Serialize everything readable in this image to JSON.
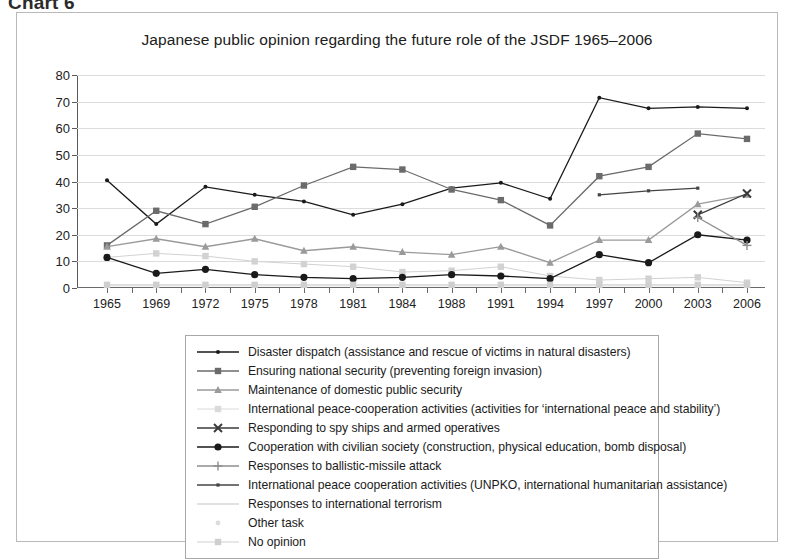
{
  "heading": "Chart 6",
  "figure": {
    "title": "Japanese public opinion regarding the future role of the JSDF 1965–2006"
  },
  "chart_data": {
    "type": "line",
    "title": "Japanese public opinion regarding the future role of the JSDF 1965–2006",
    "xlabel": "",
    "ylabel": "",
    "ylim": [
      0,
      80
    ],
    "ytick_step": 10,
    "yticks": [
      0,
      10,
      20,
      30,
      40,
      50,
      60,
      70,
      80
    ],
    "grid": true,
    "legend_position": "below-plot",
    "categories": [
      "1965",
      "1969",
      "1972",
      "1975",
      "1978",
      "1981",
      "1984",
      "1988",
      "1991",
      "1994",
      "1997",
      "2000",
      "2003",
      "2006"
    ],
    "series": [
      {
        "name": "Disaster dispatch (assistance and rescue of victims in natural disasters)",
        "marker": "diamond",
        "color": "#1a1a1a",
        "values": [
          40.5,
          24.0,
          38.0,
          35.0,
          32.5,
          27.5,
          31.5,
          37.5,
          39.5,
          33.5,
          71.5,
          67.5,
          68.0,
          67.5
        ]
      },
      {
        "name": "Ensuring national security (preventing foreign invasion)",
        "marker": "square",
        "color": "#6b6b6b",
        "values": [
          16.0,
          29.0,
          24.0,
          30.5,
          38.5,
          45.5,
          44.5,
          37.0,
          33.0,
          23.5,
          42.0,
          45.5,
          58.0,
          56.0
        ]
      },
      {
        "name": "Maintenance of domestic public security",
        "marker": "triangle",
        "color": "#9a9a9a",
        "values": [
          15.5,
          18.5,
          15.5,
          18.5,
          14.0,
          15.5,
          13.5,
          12.5,
          15.5,
          9.5,
          18.0,
          18.0,
          31.5,
          35.0
        ]
      },
      {
        "name": "International peace-cooperation activities (activities for ‘international peace and stability’)",
        "marker": "square-light",
        "color": "#d2d2d2",
        "values": [
          11.5,
          13.0,
          12.0,
          10.0,
          9.0,
          8.0,
          6.0,
          6.5,
          8.0,
          4.5,
          3.0,
          3.5,
          4.0,
          2.0
        ]
      },
      {
        "name": "Responding to spy ships and armed operatives",
        "marker": "x-mark",
        "color": "#3a3a3a",
        "values": [
          null,
          null,
          null,
          null,
          null,
          null,
          null,
          null,
          null,
          null,
          null,
          null,
          27.5,
          35.5
        ]
      },
      {
        "name": "Cooperation with civilian society (construction, physical education, bomb disposal)",
        "marker": "circle",
        "color": "#1a1a1a",
        "values": [
          11.5,
          5.5,
          7.0,
          5.0,
          4.0,
          3.5,
          4.0,
          5.0,
          4.5,
          3.5,
          12.5,
          9.5,
          20.0,
          18.0
        ]
      },
      {
        "name": "Responses to ballistic-missile attack",
        "marker": "plus",
        "color": "#8e8e8e",
        "values": [
          null,
          null,
          null,
          null,
          null,
          null,
          null,
          null,
          null,
          null,
          null,
          null,
          26.5,
          16.0
        ]
      },
      {
        "name": "International peace cooperation activities (UNPKO, international humanitarian assistance)",
        "marker": "small-dot",
        "color": "#444444",
        "values": [
          null,
          null,
          null,
          null,
          null,
          null,
          null,
          null,
          null,
          null,
          35.0,
          36.5,
          37.5,
          null
        ]
      },
      {
        "name": "Responses to international terrorism",
        "marker": "line-only",
        "color": "#bdbdbd",
        "values": [
          null,
          null,
          null,
          null,
          null,
          null,
          null,
          null,
          null,
          null,
          null,
          null,
          null,
          null
        ]
      },
      {
        "name": "Other task",
        "marker": "dot-faint",
        "color": "#e0e0e0",
        "values": [
          0.8,
          0.8,
          0.8,
          0.8,
          0.8,
          0.8,
          0.8,
          0.8,
          0.8,
          0.8,
          0.8,
          0.8,
          0.8,
          0.8
        ]
      },
      {
        "name": "No opinion",
        "marker": "square-faint",
        "color": "#cfcfcf",
        "values": [
          1.2,
          1.2,
          1.2,
          1.2,
          1.2,
          1.2,
          1.2,
          1.2,
          1.2,
          1.2,
          1.2,
          1.2,
          1.2,
          1.2
        ]
      }
    ]
  },
  "legend": {
    "items": [
      {
        "label": "Disaster dispatch (assistance and rescue of victims in natural disasters)",
        "marker": "diamond",
        "color": "#1a1a1a",
        "line": true
      },
      {
        "label": "Ensuring national security (preventing foreign invasion)",
        "marker": "square",
        "color": "#6b6b6b",
        "line": true
      },
      {
        "label": "Maintenance of domestic public security",
        "marker": "triangle",
        "color": "#9a9a9a",
        "line": true
      },
      {
        "label": "International peace-cooperation activities (activities for ‘international peace and stability’)",
        "marker": "square-light",
        "color": "#dadada",
        "line": true
      },
      {
        "label": "Responding to spy ships and armed operatives",
        "marker": "x-mark",
        "color": "#3a3a3a",
        "line": true
      },
      {
        "label": "Cooperation with civilian society (construction, physical education, bomb disposal)",
        "marker": "circle",
        "color": "#1a1a1a",
        "line": true
      },
      {
        "label": "Responses to ballistic-missile attack",
        "marker": "plus",
        "color": "#8e8e8e",
        "line": true
      },
      {
        "label": "International peace cooperation activities (UNPKO, international humanitarian assistance)",
        "marker": "small-dot",
        "color": "#444444",
        "line": true
      },
      {
        "label": "Responses to international terrorism",
        "marker": "line-only",
        "color": "#c4c4c4",
        "line": true
      },
      {
        "label": "Other task",
        "marker": "dot-faint",
        "color": "#dcdcdc",
        "line": false
      },
      {
        "label": "No opinion",
        "marker": "square-faint",
        "color": "#cfcfcf",
        "line": true
      }
    ]
  }
}
